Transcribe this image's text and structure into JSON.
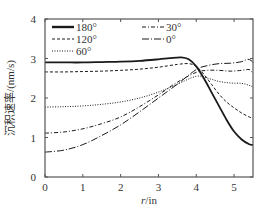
{
  "chart_data": {
    "type": "line",
    "title": "",
    "xlabel_var": "r",
    "xlabel_unit": "/in",
    "xlabel": "r/in",
    "ylabel": "沉积速率/(nm/s)",
    "xlim": [
      0,
      5.5
    ],
    "ylim": [
      0,
      4
    ],
    "xticks": [
      0,
      1,
      2,
      3,
      4,
      5
    ],
    "yticks": [
      0,
      1,
      2,
      3,
      4
    ],
    "grid": false,
    "legend_position": "upper left",
    "series": [
      {
        "name": "180°",
        "style": "solid-thick",
        "x": [
          0,
          0.5,
          1,
          1.5,
          2,
          2.5,
          3,
          3.3,
          3.6,
          3.8,
          4.0,
          4.2,
          4.4,
          4.6,
          4.8,
          5.0,
          5.2,
          5.4,
          5.5
        ],
        "values": [
          2.9,
          2.9,
          2.9,
          2.91,
          2.92,
          2.94,
          2.98,
          3.01,
          3.03,
          2.98,
          2.8,
          2.5,
          2.15,
          1.8,
          1.45,
          1.15,
          0.95,
          0.83,
          0.81
        ]
      },
      {
        "name": "120°",
        "style": "dashed",
        "x": [
          0,
          0.5,
          1,
          1.5,
          2,
          2.5,
          3,
          3.5,
          3.8,
          4.0,
          4.2,
          4.4,
          4.6,
          4.8,
          5.0,
          5.2,
          5.4,
          5.5
        ],
        "values": [
          2.66,
          2.66,
          2.67,
          2.68,
          2.7,
          2.73,
          2.78,
          2.85,
          2.87,
          2.8,
          2.6,
          2.35,
          2.1,
          1.9,
          1.75,
          1.62,
          1.52,
          1.49
        ]
      },
      {
        "name": "60°",
        "style": "dotted",
        "x": [
          0,
          0.5,
          1,
          1.5,
          2,
          2.5,
          3,
          3.5,
          4.0,
          4.3,
          4.6,
          4.9,
          5.2,
          5.4,
          5.5
        ],
        "values": [
          1.77,
          1.78,
          1.8,
          1.84,
          1.9,
          2.0,
          2.15,
          2.35,
          2.55,
          2.5,
          2.42,
          2.38,
          2.37,
          2.32,
          2.28
        ]
      },
      {
        "name": "30°",
        "style": "dash-dot",
        "x": [
          0,
          0.5,
          1,
          1.5,
          2,
          2.5,
          3,
          3.5,
          4.0,
          4.3,
          4.6,
          4.9,
          5.2,
          5.4,
          5.5
        ],
        "values": [
          1.11,
          1.14,
          1.22,
          1.35,
          1.52,
          1.78,
          2.08,
          2.4,
          2.65,
          2.7,
          2.7,
          2.68,
          2.7,
          2.72,
          2.63
        ]
      },
      {
        "name": "0°",
        "style": "long-dash-dot",
        "x": [
          0,
          0.5,
          1,
          1.5,
          2,
          2.5,
          3,
          3.5,
          4.0,
          4.3,
          4.6,
          4.9,
          5.2,
          5.35,
          5.45,
          5.5
        ],
        "values": [
          0.63,
          0.68,
          0.82,
          1.05,
          1.32,
          1.65,
          2.0,
          2.35,
          2.72,
          2.82,
          2.87,
          2.88,
          2.92,
          2.98,
          2.95,
          2.9
        ]
      }
    ]
  },
  "legend": {
    "items": [
      {
        "label": "180°",
        "style": "solid-thick"
      },
      {
        "label": "30°",
        "style": "dash-dot"
      },
      {
        "label": "120°",
        "style": "dashed"
      },
      {
        "label": "0°",
        "style": "long-dash-dot"
      },
      {
        "label": "60°",
        "style": "dotted"
      }
    ]
  },
  "colors": {
    "line": "#1a1a1a",
    "axis": "#555555",
    "text": "#333333"
  }
}
